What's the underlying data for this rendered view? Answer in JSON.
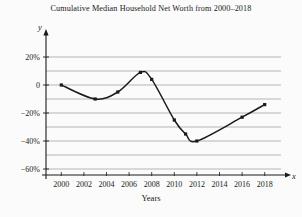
{
  "chart_data": {
    "type": "line",
    "title": "Cumulative Median Household Net Worth from 2000–2018",
    "xlabel": "Years",
    "ylabel": "",
    "x_axis_symbol": "x",
    "y_axis_symbol": "y",
    "xlim": [
      1999,
      2019
    ],
    "ylim": [
      -65,
      28
    ],
    "grid": true,
    "grid_interval": 10,
    "legend": "none",
    "x_tick_labels": [
      "2000",
      "2002",
      "2004",
      "2006",
      "2008",
      "2010",
      "2012",
      "2014",
      "2016",
      "2018"
    ],
    "x_ticks": [
      2000,
      2002,
      2004,
      2006,
      2008,
      2010,
      2012,
      2014,
      2016,
      2018
    ],
    "y_tick_labels": [
      "20%",
      "0",
      "−20%",
      "−40%",
      "−60%"
    ],
    "y_ticks": [
      20,
      0,
      -20,
      -40,
      -60
    ],
    "series": [
      {
        "name": "Cumulative median household net worth",
        "color": "#1a1a1a",
        "x": [
          2000,
          2003,
          2005,
          2007,
          2008,
          2010,
          2011,
          2012,
          2016,
          2018
        ],
        "values": [
          0,
          -10,
          -5,
          9,
          4,
          -25,
          -35,
          -40,
          -23,
          -14
        ],
        "markers": true
      }
    ]
  }
}
